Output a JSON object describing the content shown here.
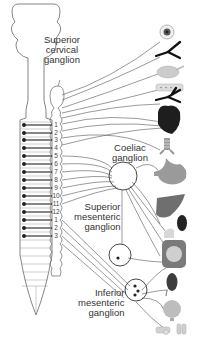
{
  "diagram": {
    "type": "anatomical",
    "colors": {
      "line": "#555555",
      "organ_dark": "#2a2a2a",
      "organ_mid": "#8a8a8a",
      "organ_light": "#c8c8c8",
      "background": "#ffffff"
    },
    "labels": {
      "superior_cervical": [
        "Superior",
        "cervical",
        "ganglion"
      ],
      "coeliac": [
        "Coeliac",
        "ganglion"
      ],
      "superior_mesenteric": [
        "Superior",
        "mesenteric",
        "ganglion"
      ],
      "inferior_mesenteric": [
        "Inferior",
        "mesenteric",
        "ganglion"
      ]
    },
    "segments": {
      "thoracic": [
        "1",
        "2",
        "3",
        "4",
        "5",
        "6",
        "7",
        "8",
        "9",
        "10",
        "11",
        "12"
      ],
      "lumbar": [
        "1",
        "2",
        "3"
      ]
    },
    "organs": [
      {
        "name": "eye",
        "icon": "eye-icon"
      },
      {
        "name": "blood-vessels-head",
        "icon": "vessel-icon"
      },
      {
        "name": "salivary-gland",
        "icon": "gland-icon"
      },
      {
        "name": "salivary-gland-2",
        "icon": "gland-strip-icon"
      },
      {
        "name": "lung-vessels",
        "icon": "vessel-icon"
      },
      {
        "name": "heart",
        "icon": "heart-icon"
      },
      {
        "name": "trachea",
        "icon": "trachea-icon"
      },
      {
        "name": "stomach",
        "icon": "stomach-icon"
      },
      {
        "name": "liver",
        "icon": "liver-icon"
      },
      {
        "name": "spleen",
        "icon": "spleen-icon"
      },
      {
        "name": "pancreas",
        "icon": "pancreas-icon"
      },
      {
        "name": "intestine",
        "icon": "intestine-icon"
      },
      {
        "name": "kidney",
        "icon": "kidney-icon"
      },
      {
        "name": "bladder",
        "icon": "bladder-icon"
      },
      {
        "name": "reproductive-organs",
        "icon": "reproductive-icon"
      }
    ]
  }
}
